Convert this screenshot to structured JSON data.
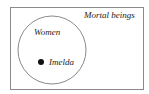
{
  "diagram": {
    "type": "euler",
    "universe_label": "Mortal beings",
    "set_label": "Women",
    "element_label": "Imelda",
    "colors": {
      "stroke": "#8a8a8a",
      "dot": "#111111",
      "text": "#222222"
    }
  }
}
